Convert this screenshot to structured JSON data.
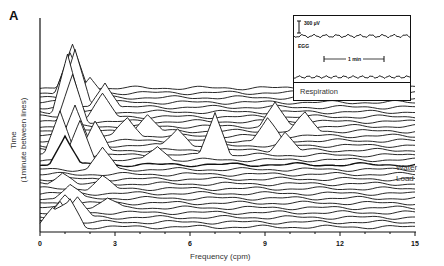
{
  "panel_label": "A",
  "inset": {
    "scale_label": "300 µV",
    "egg_label": "EGG",
    "time_scale_label": "1 min",
    "respiration_label": "Respiration"
  },
  "annotations": {
    "event_label_line1": "Water",
    "event_label_line2": "Load"
  },
  "chart_data": {
    "type": "waterfall",
    "title": "",
    "xlabel": "Frequency (cpm)",
    "ylabel_line1": "Time",
    "ylabel_line2": "(1minute between lines)",
    "x_ticks": [
      0,
      3,
      6,
      9,
      12,
      15
    ],
    "x_tick_labels": [
      "0",
      "3",
      "6",
      "9",
      "12",
      "15"
    ],
    "xlim": [
      0,
      15
    ],
    "grid": false,
    "legend": "none",
    "num_traces": 30,
    "trace_spacing_minutes": 1,
    "event": {
      "label": "Water Load",
      "trace_index": 13
    },
    "series_description": "Stacked power spectra of EGG; each line is one minute. Dominant peaks near 1-1.5 cpm and 2.5-3 cpm, transient peaks near 4.5, 5.5, 8.5-9.5 and 10.5 cpm after the water load, with a tall isolated peak near 7 cpm.",
    "peaks": [
      {
        "trace": 0,
        "freq": 0.5,
        "height": 18
      },
      {
        "trace": 0,
        "freq": 1.2,
        "height": 28
      },
      {
        "trace": 1,
        "freq": 0.8,
        "height": 22
      },
      {
        "trace": 2,
        "freq": 1.5,
        "height": 20
      },
      {
        "trace": 3,
        "freq": 1.0,
        "height": 16
      },
      {
        "trace": 4,
        "freq": 2.7,
        "height": 10
      },
      {
        "trace": 6,
        "freq": 1.2,
        "height": 14
      },
      {
        "trace": 8,
        "freq": 2.5,
        "height": 12
      },
      {
        "trace": 9,
        "freq": 0.9,
        "height": 12
      },
      {
        "trace": 12,
        "freq": 2.5,
        "height": 22
      },
      {
        "trace": 13,
        "freq": 1.0,
        "height": 30
      },
      {
        "trace": 14,
        "freq": 1.6,
        "height": 38
      },
      {
        "trace": 14,
        "freq": 4.7,
        "height": 14
      },
      {
        "trace": 15,
        "freq": 0.8,
        "height": 44
      },
      {
        "trace": 15,
        "freq": 7.0,
        "height": 44
      },
      {
        "trace": 16,
        "freq": 2.2,
        "height": 28
      },
      {
        "trace": 16,
        "freq": 9.8,
        "height": 18
      },
      {
        "trace": 17,
        "freq": 1.4,
        "height": 40
      },
      {
        "trace": 17,
        "freq": 5.5,
        "height": 18
      },
      {
        "trace": 18,
        "freq": 9.1,
        "height": 22
      },
      {
        "trace": 19,
        "freq": 3.5,
        "height": 18
      },
      {
        "trace": 20,
        "freq": 4.3,
        "height": 16
      },
      {
        "trace": 20,
        "freq": 10.6,
        "height": 18
      },
      {
        "trace": 21,
        "freq": 9.4,
        "height": 24
      },
      {
        "trace": 22,
        "freq": 1.3,
        "height": 46
      },
      {
        "trace": 23,
        "freq": 2.5,
        "height": 22
      },
      {
        "trace": 24,
        "freq": 1.1,
        "height": 58
      },
      {
        "trace": 25,
        "freq": 2.6,
        "height": 26
      },
      {
        "trace": 26,
        "freq": 1.4,
        "height": 54
      },
      {
        "trace": 27,
        "freq": 2.0,
        "height": 20
      },
      {
        "trace": 28,
        "freq": 1.2,
        "height": 40
      },
      {
        "trace": 29,
        "freq": 1.3,
        "height": 42
      }
    ]
  }
}
